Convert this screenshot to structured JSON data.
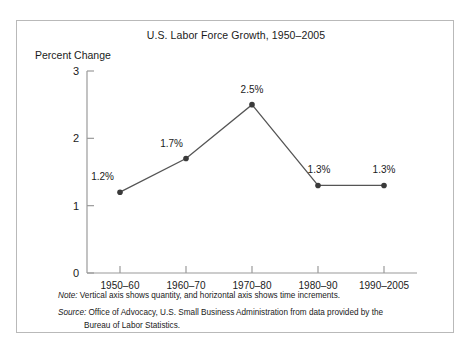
{
  "figure": {
    "title": "U.S. Labor Force Growth, 1950–2005",
    "y_axis_title": "Percent Change",
    "note": {
      "lead": "Note:",
      "text": "Vertical axis shows quantity, and horizontal axis shows time increments."
    },
    "source": {
      "lead": "Source:",
      "text": "Office of Advocacy, U.S. Small Business Administration from data provided by the",
      "text_line2": "Bureau of Labor Statistics."
    }
  },
  "chart_data": {
    "type": "line",
    "title": "U.S. Labor Force Growth, 1950–2005",
    "xlabel": "",
    "ylabel": "Percent Change",
    "categories": [
      "1950–60",
      "1960–70",
      "1970–80",
      "1980–90",
      "1990–2005"
    ],
    "values": [
      1.2,
      1.7,
      2.5,
      1.3,
      1.3
    ],
    "point_labels": [
      "1.2%",
      "1.7%",
      "2.5%",
      "1.3%",
      "1.3%"
    ],
    "ylim": [
      0,
      3
    ],
    "y_ticks": [
      0,
      1,
      2,
      3
    ],
    "y_tick_labels": [
      "0",
      "1",
      "2",
      "3"
    ],
    "grid": false,
    "legend": "none",
    "line_color": "#555555",
    "marker_color": "#3a3a3a",
    "axis_color": "#9a9a9a"
  }
}
